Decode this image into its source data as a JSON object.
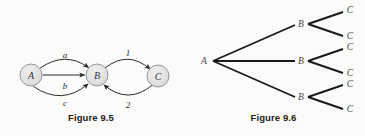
{
  "figures": [
    {
      "id": "figure-9-5",
      "caption": "Figure 9.5",
      "type": "state-transition-diagram",
      "nodes": [
        {
          "id": "A",
          "label": "A",
          "cx": 31,
          "cy": 75,
          "r": 11
        },
        {
          "id": "B",
          "label": "B",
          "cx": 97,
          "cy": 75,
          "r": 11
        },
        {
          "id": "C",
          "label": "C",
          "cx": 158,
          "cy": 76,
          "r": 11
        }
      ],
      "edges": [
        {
          "from": "A",
          "to": "B",
          "label": "a",
          "label_x": 65,
          "label_y": 58
        },
        {
          "from": "A",
          "to": "B",
          "label": "b",
          "label_x": 65,
          "label_y": 89
        },
        {
          "from": "A",
          "to": "B",
          "label": "c",
          "label_x": 65,
          "label_y": 105
        },
        {
          "from": "B",
          "to": "C",
          "label": "1",
          "label_x": 128,
          "label_y": 56
        },
        {
          "from": "C",
          "to": "B",
          "label": "2",
          "label_x": 128,
          "label_y": 108
        }
      ]
    },
    {
      "id": "figure-9-6",
      "caption": "Figure 9.6",
      "type": "tree-diagram",
      "root": {
        "label": "A",
        "x": 193,
        "y": 61
      },
      "level2": [
        {
          "label": "B",
          "x": 303,
          "y": 24
        },
        {
          "label": "B",
          "x": 303,
          "y": 61
        },
        {
          "label": "B",
          "x": 303,
          "y": 97
        }
      ],
      "level3": [
        {
          "label": "C",
          "x": 350,
          "y": 13
        },
        {
          "label": "C",
          "x": 350,
          "y": 36
        },
        {
          "label": "C",
          "x": 350,
          "y": 50
        },
        {
          "label": "C",
          "x": 350,
          "y": 73
        },
        {
          "label": "C",
          "x": 350,
          "y": 86
        },
        {
          "label": "C",
          "x": 350,
          "y": 109
        }
      ]
    }
  ],
  "colors": {
    "background": "#fbfbfa",
    "node_fill": "#e2e2e2",
    "node_stroke": "#9a9a9a",
    "edge_stroke": "#2b2b2b",
    "tree_stroke": "#1a1a1a",
    "caption_text": "#1c1c1c",
    "label_text": "#4a4a4a"
  }
}
